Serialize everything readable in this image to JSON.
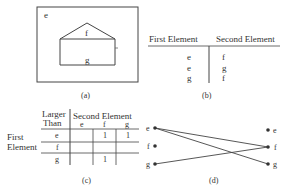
{
  "panel_a": {
    "caption": "(a)",
    "outer_label": "e",
    "roof_label": "f",
    "body_label": "g"
  },
  "panel_b": {
    "caption": "(b)",
    "headers": [
      "First Element",
      "Second Element"
    ],
    "rows": [
      [
        "e",
        "f"
      ],
      [
        "e",
        "g"
      ],
      [
        "g",
        "f"
      ]
    ]
  },
  "panel_c": {
    "caption": "(c)",
    "corner_label_line1": "Larger",
    "corner_label_line2": "Than",
    "col_group_label": "Second Element",
    "row_group_label_line1": "First",
    "row_group_label_line2": "Element",
    "col_headers": [
      "e",
      "f",
      "g"
    ],
    "row_headers": [
      "e",
      "f",
      "g"
    ],
    "cells": [
      [
        "",
        "1",
        "1"
      ],
      [
        "",
        "",
        ""
      ],
      [
        "",
        "1",
        ""
      ]
    ]
  },
  "panel_d": {
    "caption": "(d)",
    "left_nodes": [
      "e",
      "f",
      "g"
    ],
    "right_nodes": [
      "e",
      "f",
      "g"
    ],
    "edges": [
      [
        "e",
        "f"
      ],
      [
        "e",
        "g"
      ],
      [
        "g",
        "f"
      ]
    ]
  }
}
